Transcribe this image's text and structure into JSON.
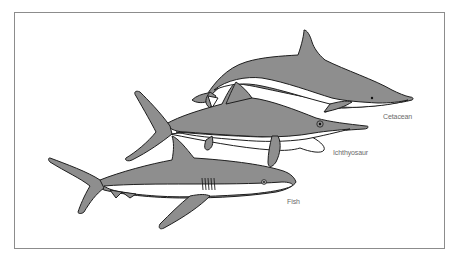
{
  "figure": {
    "colors": {
      "body_fill": "#8e8e8e",
      "belly_fill": "#ffffff",
      "outline": "#1e1e1e",
      "frame_border": "#8c8c8c",
      "label_text": "#6a6a6a"
    },
    "animals": [
      {
        "id": "cetacean",
        "label": "Cetacean"
      },
      {
        "id": "ichthyosaur",
        "label": "Ichthyosaur"
      },
      {
        "id": "fish",
        "label": "Fish"
      }
    ]
  }
}
